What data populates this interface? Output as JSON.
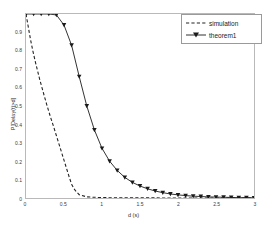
{
  "chart_data": {
    "type": "line",
    "title": "",
    "xlabel": "d (s)",
    "ylabel": "P[Delay(t)>d]",
    "xlim": [
      0,
      3
    ],
    "ylim": [
      0,
      1
    ],
    "xticks": [
      "0",
      "0.5",
      "1",
      "1.5",
      "2",
      "2.5",
      "3"
    ],
    "xtick_values": [
      0,
      0.5,
      1,
      1.5,
      2,
      2.5,
      3
    ],
    "yticks": [
      "0",
      "0.1",
      "0.2",
      "0.3",
      "0.4",
      "0.5",
      "0.6",
      "0.7",
      "0.8",
      "0.9"
    ],
    "ytick_values": [
      0,
      0.1,
      0.2,
      0.3,
      0.4,
      0.5,
      0.6,
      0.7,
      0.8,
      0.9
    ],
    "grid": false,
    "legend_position": "top-right",
    "series": [
      {
        "name": "simulation",
        "style": "dashed",
        "color": "#222222",
        "marker": "none",
        "x": [
          0.0,
          0.03,
          0.06,
          0.09,
          0.12,
          0.15,
          0.18,
          0.21,
          0.24,
          0.27,
          0.3,
          0.33,
          0.36,
          0.39,
          0.42,
          0.45,
          0.48,
          0.51,
          0.54,
          0.57,
          0.6,
          0.64,
          0.7,
          0.8,
          1.0,
          1.4,
          2.0,
          2.6,
          3.0
        ],
        "values": [
          1.0,
          0.93,
          0.86,
          0.8,
          0.745,
          0.695,
          0.645,
          0.6,
          0.555,
          0.512,
          0.47,
          0.43,
          0.392,
          0.352,
          0.312,
          0.272,
          0.232,
          0.192,
          0.152,
          0.112,
          0.075,
          0.045,
          0.018,
          0.006,
          0.002,
          0.001,
          0.0,
          0.0,
          0.0
        ]
      },
      {
        "name": "theorem1",
        "style": "solid",
        "color": "#1a1a1a",
        "marker": "triangle-down",
        "x": [
          0.0,
          0.1,
          0.2,
          0.3,
          0.4,
          0.5,
          0.6,
          0.7,
          0.8,
          0.9,
          1.0,
          1.1,
          1.2,
          1.3,
          1.4,
          1.5,
          1.6,
          1.7,
          1.8,
          1.9,
          2.0,
          2.1,
          2.2,
          2.3,
          2.4,
          2.5,
          2.6,
          2.7,
          2.8,
          2.9,
          3.0
        ],
        "values": [
          1.0,
          1.0,
          1.0,
          1.0,
          0.995,
          0.94,
          0.83,
          0.66,
          0.5,
          0.37,
          0.27,
          0.2,
          0.15,
          0.112,
          0.085,
          0.065,
          0.05,
          0.038,
          0.029,
          0.022,
          0.017,
          0.013,
          0.01,
          0.008,
          0.006,
          0.005,
          0.004,
          0.003,
          0.002,
          0.002,
          0.001
        ]
      }
    ]
  },
  "legend": {
    "items": [
      {
        "label": "simulation"
      },
      {
        "label": "theorem1"
      }
    ]
  }
}
